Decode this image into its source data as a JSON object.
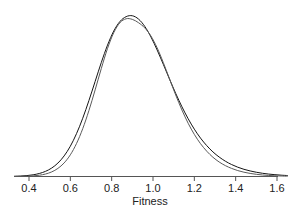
{
  "figure": {
    "background_color": "#ffffff",
    "width": 301,
    "height": 217
  },
  "axis": {
    "x_title": "Fitness",
    "tick_labels": [
      "0.4",
      "0.6",
      "0.8",
      "1.0",
      "1.2",
      "1.4",
      "1.6"
    ],
    "tick_values": [
      0.4,
      0.6,
      0.8,
      1.0,
      1.2,
      1.4,
      1.6
    ],
    "line_color": "#555555",
    "y_axis_visible": false,
    "grid": false
  },
  "chart_data": {
    "type": "line",
    "title": "",
    "subtitle": "",
    "xlabel": "Fitness",
    "ylabel": "",
    "xlim": [
      0.33,
      1.65
    ],
    "ylim": [
      0,
      2.75
    ],
    "xticks": [
      0.4,
      0.6,
      0.8,
      1.0,
      1.2,
      1.4,
      1.6
    ],
    "xtick_labels": [
      "0.4",
      "0.6",
      "0.8",
      "1.0",
      "1.2",
      "1.4",
      "1.6"
    ],
    "grid": false,
    "legend": "none",
    "series": [
      {
        "name": "curve-1",
        "color": "#141414",
        "linewidth": 1.0,
        "peak_x": 0.9,
        "peak_y": 2.66,
        "x": [
          0.33,
          0.36,
          0.39,
          0.42,
          0.45,
          0.48,
          0.51,
          0.54,
          0.57,
          0.6,
          0.63,
          0.66,
          0.69,
          0.72,
          0.75,
          0.78,
          0.81,
          0.84,
          0.87,
          0.9,
          0.93,
          0.96,
          0.99,
          1.02,
          1.05,
          1.08,
          1.11,
          1.14,
          1.17,
          1.2,
          1.23,
          1.26,
          1.29,
          1.32,
          1.35,
          1.38,
          1.41,
          1.44,
          1.47,
          1.5,
          1.53,
          1.56,
          1.59,
          1.62,
          1.65
        ],
        "y": [
          0.004,
          0.008,
          0.015,
          0.028,
          0.05,
          0.085,
          0.14,
          0.222,
          0.34,
          0.5,
          0.708,
          0.962,
          1.255,
          1.57,
          1.884,
          2.17,
          2.402,
          2.56,
          2.64,
          2.655,
          2.6,
          2.48,
          2.305,
          2.09,
          1.852,
          1.608,
          1.372,
          1.152,
          0.955,
          0.782,
          0.634,
          0.51,
          0.406,
          0.322,
          0.253,
          0.198,
          0.154,
          0.119,
          0.092,
          0.07,
          0.053,
          0.04,
          0.03,
          0.022,
          0.016
        ]
      },
      {
        "name": "curve-2",
        "color": "#5a5a5a",
        "linewidth": 1.0,
        "peak_x": 0.97,
        "peak_y": 2.53,
        "x": [
          0.33,
          0.36,
          0.39,
          0.42,
          0.45,
          0.48,
          0.51,
          0.54,
          0.57,
          0.6,
          0.63,
          0.66,
          0.69,
          0.72,
          0.75,
          0.78,
          0.81,
          0.84,
          0.87,
          0.9,
          0.93,
          0.96,
          0.99,
          1.02,
          1.05,
          1.08,
          1.11,
          1.14,
          1.17,
          1.2,
          1.23,
          1.26,
          1.29,
          1.32,
          1.35,
          1.38,
          1.41,
          1.44,
          1.47,
          1.5,
          1.53,
          1.56,
          1.59,
          1.62,
          1.65
        ],
        "y": [
          0.001,
          0.002,
          0.005,
          0.01,
          0.021,
          0.041,
          0.076,
          0.134,
          0.224,
          0.358,
          0.545,
          0.79,
          1.09,
          1.43,
          1.785,
          2.115,
          2.375,
          2.54,
          2.605,
          2.595,
          2.54,
          2.455,
          2.32,
          2.125,
          1.88,
          1.612,
          1.345,
          1.098,
          0.88,
          0.695,
          0.542,
          0.418,
          0.318,
          0.24,
          0.18,
          0.134,
          0.098,
          0.071,
          0.051,
          0.036,
          0.025,
          0.017,
          0.012,
          0.008,
          0.005
        ]
      }
    ]
  }
}
